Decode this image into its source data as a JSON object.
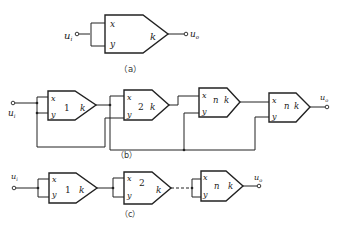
{
  "figure": {
    "subfigures": [
      {
        "id": "a",
        "caption": "（a）",
        "input_label": "u",
        "input_sub": "i",
        "output_label": "u",
        "output_sub": "o",
        "block": {
          "port_x": "x",
          "port_y": "y",
          "gain": "k"
        }
      },
      {
        "id": "b",
        "caption": "（b）",
        "input_label": "u",
        "input_sub": "i",
        "output_label": "u",
        "output_sub": "o",
        "blocks": [
          {
            "port_x": "x",
            "port_y": "y",
            "index": "1",
            "gain": "k"
          },
          {
            "port_x": "x",
            "port_y": "y",
            "index": "2",
            "gain": "k"
          },
          {
            "port_x": "x",
            "port_y": "y",
            "index": "n",
            "gain": "k"
          },
          {
            "port_x": "x",
            "port_y": "y",
            "index": "n",
            "gain": "k"
          }
        ]
      },
      {
        "id": "c",
        "caption": "（c）",
        "input_label": "u",
        "input_sub": "i",
        "output_label": "u",
        "output_sub": "o",
        "blocks": [
          {
            "port_x": "x",
            "port_y": "y",
            "index": "1",
            "gain": "k"
          },
          {
            "port_x": "x",
            "port_y": "y",
            "index": "2",
            "gain": "k"
          },
          {
            "port_x": "x",
            "port_y": "y",
            "index": "n",
            "gain": "k"
          }
        ]
      }
    ]
  }
}
